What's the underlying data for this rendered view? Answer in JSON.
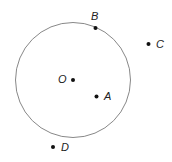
{
  "diagram": {
    "circle": {
      "cx": 73,
      "cy": 80,
      "r": 57.5,
      "stroke": "#888888"
    },
    "points": [
      {
        "name": "O",
        "x": 73,
        "y": 80,
        "label_x": 58,
        "label_y": 74
      },
      {
        "name": "B",
        "x": 95.5,
        "y": 28,
        "label_x": 91,
        "label_y": 11
      },
      {
        "name": "C",
        "x": 148.5,
        "y": 44,
        "label_x": 156,
        "label_y": 39
      },
      {
        "name": "A",
        "x": 96.5,
        "y": 96.5,
        "label_x": 104,
        "label_y": 91
      },
      {
        "name": "D",
        "x": 53,
        "y": 147,
        "label_x": 61,
        "label_y": 142
      }
    ]
  }
}
